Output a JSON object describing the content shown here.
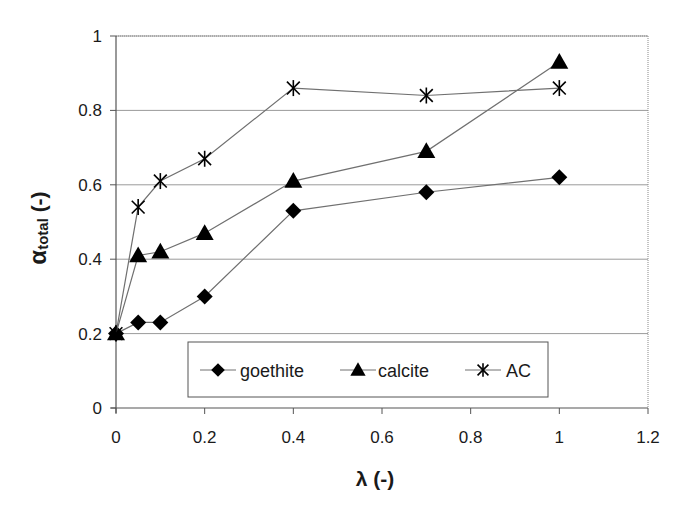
{
  "chart_data": {
    "type": "line",
    "title": "",
    "xlabel": "λ (-)",
    "ylabel_main": "α",
    "ylabel_sub": "total",
    "ylabel_suffix": " (-)",
    "xlim": [
      0,
      1.2
    ],
    "ylim": [
      0,
      1
    ],
    "xticks": [
      "0",
      "0.2",
      "0.4",
      "0.6",
      "0.8",
      "1",
      "1.2"
    ],
    "yticks": [
      "0",
      "0.2",
      "0.4",
      "0.6",
      "0.8",
      "1"
    ],
    "grid": {
      "horizontal": true,
      "vertical": false
    },
    "legend_position": "inside-bottom-center",
    "x": [
      0,
      0.05,
      0.1,
      0.2,
      0.4,
      0.7,
      1.0
    ],
    "series": [
      {
        "name": "goethite",
        "marker": "diamond",
        "values": [
          0.2,
          0.23,
          0.23,
          0.3,
          0.53,
          0.58,
          0.62
        ]
      },
      {
        "name": "calcite",
        "marker": "triangle",
        "values": [
          0.2,
          0.41,
          0.42,
          0.47,
          0.61,
          0.69,
          0.93
        ]
      },
      {
        "name": "AC",
        "marker": "asterisk",
        "values": [
          0.2,
          0.54,
          0.61,
          0.67,
          0.86,
          0.84,
          0.86
        ]
      }
    ],
    "colors": {
      "line": "#707070",
      "marker": "#000000",
      "grid": "#9a9a9a",
      "axis": "#555555"
    }
  }
}
